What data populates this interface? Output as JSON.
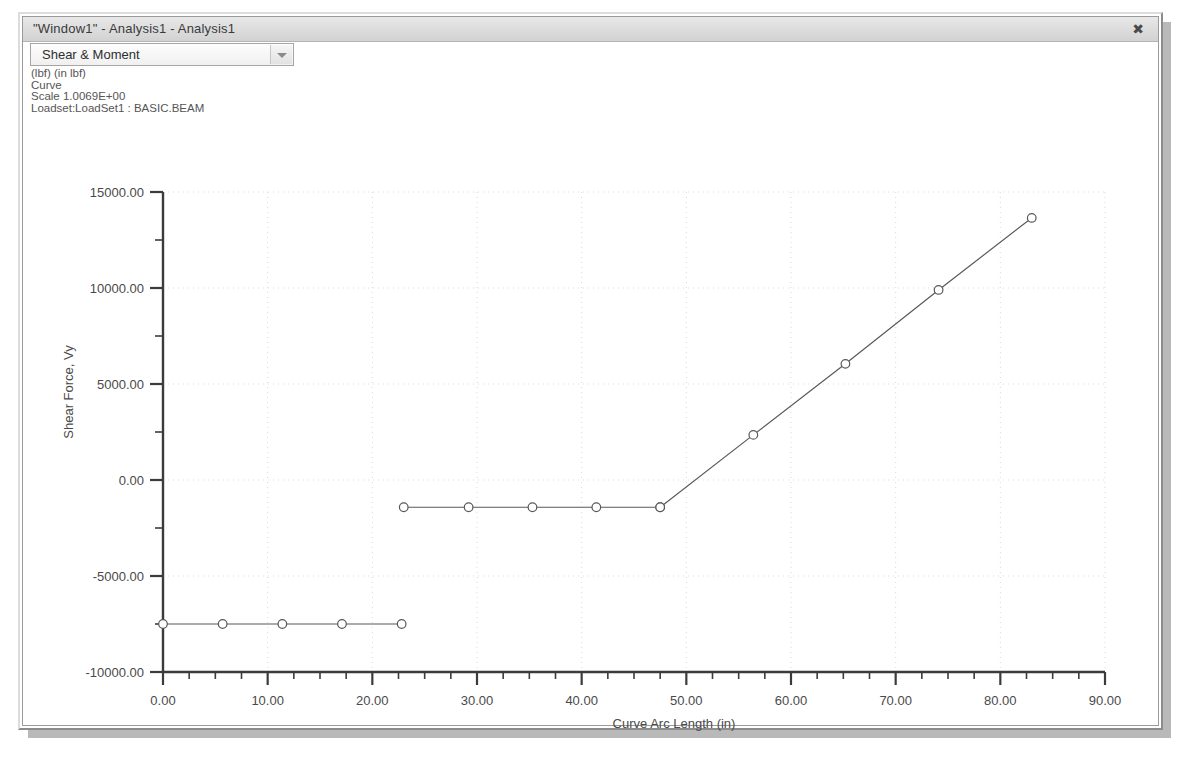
{
  "window": {
    "title": "\"Window1\" - Analysis1 - Analysis1",
    "close_icon": "close-icon",
    "close_glyph": "✖"
  },
  "toolbar": {
    "result_select_value": "Shear & Moment",
    "dropdown_icon": "chevron-down-icon"
  },
  "annotation": {
    "line1": "(lbf)  (in lbf)",
    "line2": "Curve",
    "line3": "Scale  1.0069E+00",
    "line4": "Loadset:LoadSet1 :  BASIC.BEAM"
  },
  "legend": {
    "entries": [
      {
        "label": "Shear Force, Vy",
        "marker": "circle"
      }
    ]
  },
  "chart_data": {
    "type": "line",
    "title": "",
    "xlabel": "Curve Arc Length (in)",
    "ylabel": "Shear Force, Vy",
    "xlim": [
      0,
      90
    ],
    "ylim": [
      -10000,
      15000
    ],
    "xticks": [
      0,
      10,
      20,
      30,
      40,
      50,
      60,
      70,
      80,
      90
    ],
    "xticklabels": [
      "0.00",
      "10.00",
      "20.00",
      "30.00",
      "40.00",
      "50.00",
      "60.00",
      "70.00",
      "80.00",
      "90.00"
    ],
    "yticks": [
      -10000,
      -5000,
      0,
      5000,
      10000,
      15000
    ],
    "yticklabels": [
      "-10000.00",
      "-5000.00",
      "0.00",
      "5000.00",
      "10000.00",
      "15000.00"
    ],
    "x_minor_step": 2.5,
    "y_minor_step": 2500,
    "grid": true,
    "legend_position": "below-axis-left",
    "series": [
      {
        "name": "Shear Force, Vy",
        "marker": "circle",
        "segments": [
          {
            "name": "lower-constant",
            "points": [
              {
                "x": 0.0,
                "y": -7500
              },
              {
                "x": 5.7,
                "y": -7500
              },
              {
                "x": 11.4,
                "y": -7500
              },
              {
                "x": 17.1,
                "y": -7500
              },
              {
                "x": 22.8,
                "y": -7500
              }
            ]
          },
          {
            "name": "mid-constant",
            "points": [
              {
                "x": 23.0,
                "y": -1420
              },
              {
                "x": 29.2,
                "y": -1420
              },
              {
                "x": 35.3,
                "y": -1420
              },
              {
                "x": 41.4,
                "y": -1420
              },
              {
                "x": 47.5,
                "y": -1420
              }
            ]
          },
          {
            "name": "rising-ramp",
            "points": [
              {
                "x": 47.5,
                "y": -1420
              },
              {
                "x": 56.4,
                "y": 2350
              },
              {
                "x": 65.2,
                "y": 6050
              },
              {
                "x": 74.1,
                "y": 9900
              },
              {
                "x": 83.0,
                "y": 13650
              }
            ]
          }
        ]
      }
    ]
  }
}
